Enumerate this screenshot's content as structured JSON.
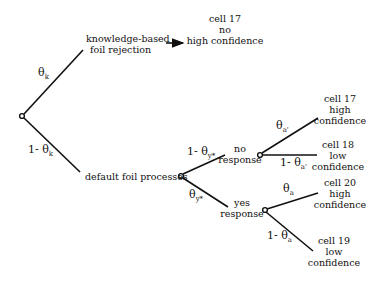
{
  "diagram": {
    "type": "processing-tree",
    "nodes": {
      "knowledge": {
        "line1": "knowledge-based",
        "line2": "foil rejection"
      },
      "default": {
        "label": "default foil processes"
      },
      "no_response": {
        "line1": "no",
        "line2": "response"
      },
      "yes_response": {
        "line1": "yes",
        "line2": "response"
      }
    },
    "outcomes": {
      "top": {
        "line1": "cell 17",
        "line2": "no",
        "line3": "high confidence"
      },
      "no_high": {
        "line1": "cell 17",
        "line2": "high",
        "line3": "confidence"
      },
      "no_low": {
        "line1": "cell 18",
        "line2": "low",
        "line3": "confidence"
      },
      "yes_high": {
        "line1": "cell 20",
        "line2": "high",
        "line3": "confidence"
      },
      "yes_low": {
        "line1": "cell 19",
        "line2": "low",
        "line3": "confidence"
      }
    },
    "edges": {
      "theta_k": {
        "prefix": "",
        "sym": "θ",
        "sub": "k"
      },
      "one_minus_theta_k": {
        "prefix": "1-",
        "sym": "θ",
        "sub": "k"
      },
      "one_minus_theta_ystar": {
        "prefix": "1-",
        "sym": "θ",
        "sub": "y*"
      },
      "theta_ystar": {
        "prefix": "",
        "sym": "θ",
        "sub": "y*"
      },
      "theta_aprime": {
        "prefix": "",
        "sym": "θ",
        "sub": "a'"
      },
      "one_minus_theta_aprime": {
        "prefix": "1-",
        "sym": "θ",
        "sub": "a'"
      },
      "theta_a": {
        "prefix": "",
        "sym": "θ",
        "sub": "a"
      },
      "one_minus_theta_a": {
        "prefix": "1-",
        "sym": "θ",
        "sub": "a"
      }
    }
  }
}
